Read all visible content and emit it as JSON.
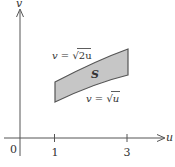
{
  "figure": {
    "axes": {
      "x_label": "u",
      "y_label": "v",
      "origin_label": "0",
      "x_ticks": [
        {
          "label": "1",
          "value": 1
        },
        {
          "label": "3",
          "value": 3
        }
      ]
    },
    "region": {
      "label": "S",
      "upper_curve_label": "v = √2u",
      "lower_curve_label": "v = √u",
      "u_range": [
        1,
        3
      ],
      "fill_color": "#c6c6c6",
      "stroke_color": "#555555"
    },
    "upper_label_parts": {
      "lhs": "v",
      "eq": " = ",
      "root": "√",
      "arg": "2u"
    },
    "lower_label_parts": {
      "lhs": "v",
      "eq": " = ",
      "root": "√",
      "arg": "u"
    }
  }
}
